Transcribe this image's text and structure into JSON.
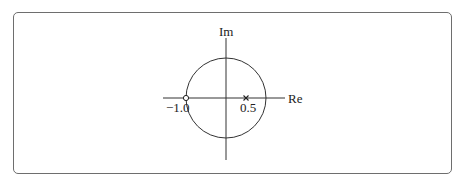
{
  "diagram": {
    "type": "pole-zero plot",
    "axes": {
      "horizontal_label": "Re",
      "vertical_label": "Im"
    },
    "unit_circle": true,
    "zero": {
      "value": -1.0,
      "label": "−1.0",
      "marker": "circle"
    },
    "pole": {
      "value": 0.5,
      "label": "0.5",
      "marker": "cross"
    },
    "colors": {
      "stroke": "#333333",
      "frame": "#6e6e6e"
    }
  }
}
